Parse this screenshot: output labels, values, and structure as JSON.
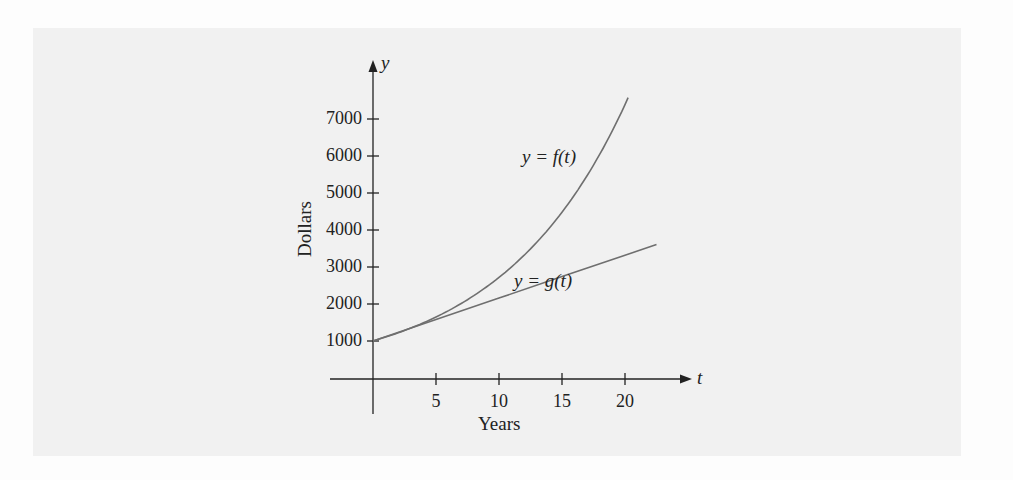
{
  "chart_data": {
    "type": "line",
    "title": "",
    "xlabel": "Years",
    "ylabel": "Dollars",
    "x_axis_symbol": "t",
    "y_axis_symbol": "y",
    "x_ticks": [
      5,
      10,
      15,
      20
    ],
    "y_ticks": [
      1000,
      2000,
      3000,
      4000,
      5000,
      6000,
      7000
    ],
    "xlim": [
      0,
      25
    ],
    "ylim": [
      0,
      8000
    ],
    "grid": false,
    "legend": "inline annotations",
    "series": [
      {
        "name": "y = f(t)",
        "style": "exponential curve",
        "x": [
          0,
          2.5,
          5,
          7.5,
          10,
          12.5,
          15,
          17.5,
          20,
          20.3
        ],
        "values": [
          1000,
          1284,
          1649,
          2117,
          2718,
          3490,
          4482,
          5755,
          7389,
          7600
        ]
      },
      {
        "name": "y = g(t)",
        "style": "straight line",
        "x": [
          0,
          5,
          10,
          15,
          20,
          22.5
        ],
        "values": [
          1000,
          1580,
          2160,
          2740,
          3320,
          3610
        ]
      }
    ],
    "annotations": [
      {
        "text": "y = f(t)",
        "near": [
          12.5,
          6000
        ]
      },
      {
        "text": "y = g(t)",
        "near": [
          12,
          2600
        ]
      }
    ]
  },
  "labels": {
    "y_axis_symbol": "y",
    "x_axis_symbol": "t",
    "ylabel": "Dollars",
    "xlabel": "Years",
    "f_label": "y = f(t)",
    "g_label": "y = g(t)",
    "y_ticks": [
      "7000",
      "6000",
      "5000",
      "4000",
      "3000",
      "2000",
      "1000"
    ],
    "x_ticks": [
      "5",
      "10",
      "15",
      "20"
    ]
  },
  "colors": {
    "axis": "#222222",
    "curve": "#6f6f6f",
    "background_panel": "#f1f1f1"
  }
}
